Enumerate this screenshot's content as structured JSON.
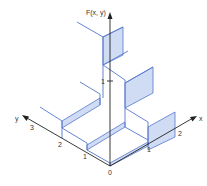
{
  "figure": {
    "title": "F(x, y)",
    "axes": {
      "vertical_label": "F(x, y)",
      "x_label": "x",
      "y_label": "y",
      "origin_label": "0",
      "vertical_ticks": [
        "1"
      ],
      "x_ticks": [
        "1",
        "2"
      ],
      "y_ticks": [
        "1",
        "2",
        "3"
      ]
    },
    "colors": {
      "axis": "#222222",
      "surface_edge": "#5577cc",
      "surface_fill": "#cfdcf4"
    }
  }
}
